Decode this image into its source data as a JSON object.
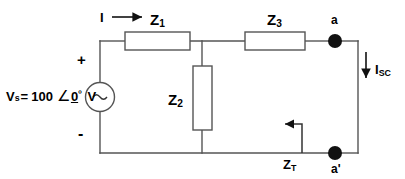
{
  "diagram": {
    "background_color": "#ffffff",
    "line_color": "#444444",
    "text_color": "#000000"
  },
  "labels": {
    "current_in": "I",
    "impedance_1": "Z",
    "impedance_1_sub": "1",
    "impedance_2": "Z",
    "impedance_2_sub": "2",
    "impedance_3": "Z",
    "impedance_3_sub": "3",
    "impedance_thevenin": "Z",
    "impedance_thevenin_sub": "T",
    "node_a": "a",
    "node_a_prime": "a'",
    "short_circuit_current": "I",
    "short_circuit_current_sub": "SC",
    "polarity_plus": "+",
    "polarity_minus": "-",
    "source_symbol": "~"
  },
  "source": {
    "name": "V",
    "name_sub": "s",
    "equals": "=",
    "magnitude": "100",
    "angle_glyph": "∠",
    "angle_value": "0",
    "degree_symbol": "º",
    "unit": "V",
    "full_text": "Vs = 100 ∠0º V"
  },
  "icons": {
    "current_arrow_i": "arrow-right-icon",
    "current_arrow_isc": "arrow-down-icon",
    "impedance_arrow_zt": "arrow-left-icon",
    "ac_source": "ac-source-icon",
    "terminal_node": "filled-node-dot-icon"
  }
}
